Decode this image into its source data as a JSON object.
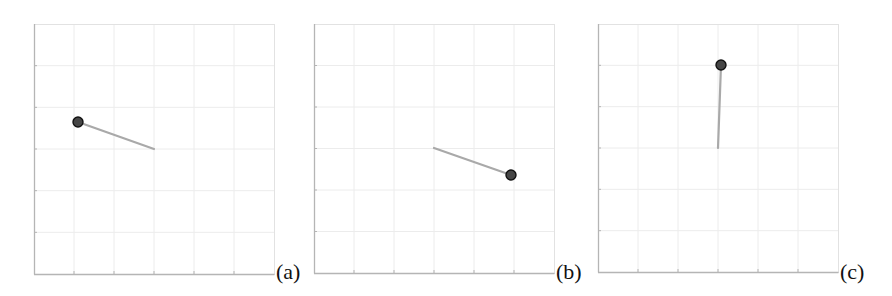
{
  "figure": {
    "panels": [
      {
        "id": "a",
        "label": "(a)",
        "frame": {
          "x": 34,
          "y": 24,
          "w": 240,
          "h": 250
        },
        "pivot": {
          "dx": 120,
          "dy": 125
        },
        "bob": {
          "dx": 44,
          "dy": 98
        },
        "label_pos": {
          "x": 276,
          "y": 261
        }
      },
      {
        "id": "b",
        "label": "(b)",
        "frame": {
          "x": 314,
          "y": 24,
          "w": 240,
          "h": 249
        },
        "pivot": {
          "dx": 120,
          "dy": 124
        },
        "bob": {
          "dx": 197,
          "dy": 151
        },
        "label_pos": {
          "x": 556,
          "y": 261
        }
      },
      {
        "id": "c",
        "label": "(c)",
        "frame": {
          "x": 598,
          "y": 24,
          "w": 240,
          "h": 248
        },
        "pivot": {
          "dx": 120,
          "dy": 124
        },
        "bob": {
          "dx": 123,
          "dy": 41
        },
        "label_pos": {
          "x": 840,
          "y": 261
        }
      }
    ],
    "grid": {
      "divisions_x": 6,
      "divisions_y": 6
    },
    "colors": {
      "grid": "#ececec",
      "axis": "#b5b5b5",
      "rod": "#a9a9a9",
      "bob_fill": "#454545",
      "bob_stroke": "#111111"
    },
    "bob_radius": 5,
    "rod_width": 2.2
  }
}
